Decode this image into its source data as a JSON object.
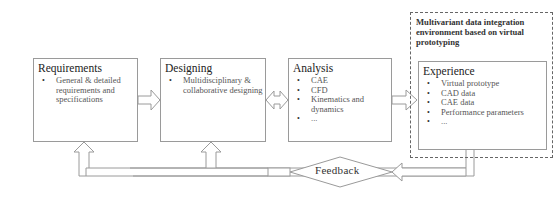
{
  "environment": {
    "title": "Multivariant data integration environment based on virtual prototyping"
  },
  "stages": [
    {
      "title": "Requirements",
      "items": [
        "General & detailed requirements and specifications"
      ]
    },
    {
      "title": "Designing",
      "items": [
        "Multidisciplinary & collaborative designing"
      ]
    },
    {
      "title": "Analysis",
      "items": [
        "CAE",
        "CFD",
        "Kinematics and dynamics",
        "..."
      ]
    },
    {
      "title": "Experience",
      "items": [
        "Virtual prototype",
        "CAD data",
        "CAE data",
        "Performance parameters",
        "..."
      ]
    }
  ],
  "feedback": {
    "label": "Feedback"
  },
  "colors": {
    "line": "#9a9a9a",
    "dashed_border": "#666666",
    "text": "#333333"
  }
}
